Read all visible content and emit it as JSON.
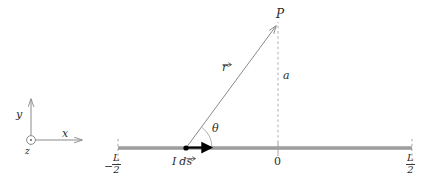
{
  "figure": {
    "kind": "physics-diagram",
    "background_color": "#ffffff",
    "wire_color": "#9a9a9a",
    "line_color": "#8a8a8a",
    "text_color": "#2b2b2b",
    "accent_color": "#000000"
  },
  "axes_triad": {
    "y_label": "y",
    "x_label": "x",
    "z_label": "z",
    "z_marker": "circle-dot-out-of-page"
  },
  "wire": {
    "left_endpoint_sign": "−",
    "left_endpoint_numerator": "L",
    "left_endpoint_denominator": "2",
    "right_endpoint_numerator": "L",
    "right_endpoint_denominator": "2",
    "origin_label": "0"
  },
  "source_element": {
    "current_symbol": "I",
    "differential_symbol": "d",
    "vector_symbol": "s",
    "full_label": "I ds",
    "marker": "filled-dot"
  },
  "vectors": {
    "r_symbol": "r",
    "r_label": "r⃗",
    "a_label": "a",
    "theta_label": "θ"
  },
  "field_point": {
    "label": "P",
    "style": "script"
  }
}
